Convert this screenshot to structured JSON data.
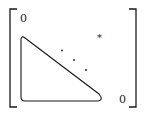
{
  "diagram": {
    "type": "matrix-structure",
    "labels": {
      "top_left_zero": "0",
      "bottom_right_zero": "0",
      "upper_right_entry": "*"
    },
    "elements": [
      {
        "name": "left-bracket",
        "shape": "square-bracket"
      },
      {
        "name": "right-bracket",
        "shape": "square-bracket"
      },
      {
        "name": "lower-triangle-block",
        "shape": "rounded-triangle"
      },
      {
        "name": "diagonal-dots",
        "count": 3
      },
      {
        "name": "asterisk",
        "text": "*"
      }
    ],
    "colors": {
      "stroke": "#1a1a1a",
      "background": "#ffffff"
    }
  }
}
